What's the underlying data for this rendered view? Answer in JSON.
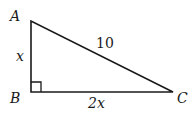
{
  "figure": {
    "type": "right-triangle",
    "vertices": {
      "A": {
        "label": "A",
        "x": 31,
        "y": 21
      },
      "B": {
        "label": "B",
        "x": 31,
        "y": 92
      },
      "C": {
        "label": "C",
        "x": 173,
        "y": 92
      }
    },
    "sides": {
      "AB": {
        "label": "x"
      },
      "BC": {
        "label": "2x"
      },
      "AC": {
        "label": "10"
      }
    },
    "right_angle_at": "B",
    "colors": {
      "stroke": "#1a1a1a",
      "background": "#ffffff"
    }
  }
}
